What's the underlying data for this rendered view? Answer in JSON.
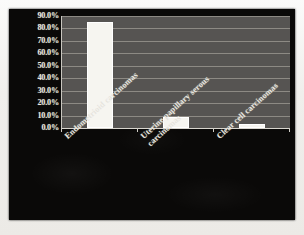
{
  "chart_data": {
    "type": "bar",
    "title": "",
    "subtitle": "",
    "xlabel": "",
    "ylabel": "",
    "categories": [
      "Endometrioid carcinomas",
      "Uterine papillary serous\ncarcinomas",
      "Clear cell carcinomas"
    ],
    "values": [
      85.0,
      9.0,
      3.5
    ],
    "value_labels": [
      "85.0%",
      "9.0%",
      "3.5%"
    ],
    "ylim": [
      0,
      90
    ],
    "ytick_values": [
      0,
      10,
      20,
      30,
      40,
      50,
      60,
      70,
      80,
      90
    ],
    "ytick_labels": [
      "0.0%",
      "10.0%",
      "20.0%",
      "30.0%",
      "40.0%",
      "50.0%",
      "60.0%",
      "70.0%",
      "80.0%",
      "90.0%"
    ],
    "grid": true,
    "grid_axis": "y",
    "legend": false,
    "legend_position": "none",
    "series": [
      {
        "name": "Proportion of cases",
        "values": [
          85.0,
          9.0,
          3.5
        ]
      }
    ],
    "xtick_label_rotation": -42,
    "colors": {
      "figure_background": "#0a0908",
      "plot_background": "#565452",
      "gridline": "#8d8a84",
      "axis_line": "#d8d5ce",
      "bar_fill": "#f6f5f0",
      "bar_edge": "#ffffff",
      "tick_text": "#e8e6df",
      "page_margin": "#f2f1ee"
    }
  }
}
